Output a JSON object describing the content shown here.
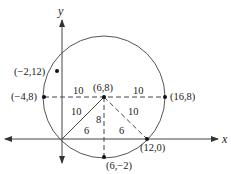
{
  "colors": {
    "stroke": "#444444",
    "text": "#222222",
    "background": "#ffffff"
  },
  "axes": {
    "x_label": "x",
    "y_label": "y"
  },
  "circle": {
    "center_label": "(6,8)",
    "radius": 10
  },
  "points": {
    "center": "(6,8)",
    "left": "(−4,8)",
    "right": "(16,8)",
    "bottom": "(6,−2)",
    "x_intercept": "(12,0)",
    "outside": "(−2,12)"
  },
  "segment_labels": {
    "left_radius": "10",
    "right_radius": "10",
    "diag_left": "10",
    "diag_right": "10",
    "height": "8",
    "base_left": "6",
    "base_right": "6"
  }
}
